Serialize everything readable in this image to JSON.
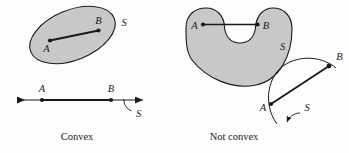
{
  "figure": {
    "title_present": false,
    "background_color": "#fdfdfd",
    "region_fill_color": "#c8c8c8",
    "stroke_color": "#1a1a1a"
  },
  "panels": [
    {
      "id": "convex",
      "caption": "Convex",
      "shapes": [
        {
          "id": "ellipse-region",
          "kind": "filled-region",
          "labels": {
            "set": "S",
            "point_a": "A",
            "point_b": "B"
          }
        },
        {
          "id": "number-line",
          "kind": "line-with-arrows",
          "labels": {
            "set": "S",
            "point_a": "A",
            "point_b": "B"
          }
        }
      ]
    },
    {
      "id": "not-convex",
      "caption": "Not convex",
      "shapes": [
        {
          "id": "horseshoe-region",
          "kind": "filled-region",
          "labels": {
            "set": "S",
            "point_a": "A",
            "point_b": "B"
          }
        },
        {
          "id": "arc-curve",
          "kind": "open-arc",
          "labels": {
            "set": "S",
            "point_a": "A",
            "point_b": "B"
          }
        }
      ]
    }
  ],
  "labels": {
    "ellipse": {
      "a": "A",
      "b": "B",
      "s": "S"
    },
    "numberline": {
      "a": "A",
      "b": "B",
      "s": "S"
    },
    "horseshoe": {
      "a": "A",
      "b": "B",
      "s": "S"
    },
    "arc": {
      "a": "A",
      "b": "B",
      "s": "S"
    }
  },
  "captions": {
    "left": "Convex",
    "right": "Not convex"
  }
}
